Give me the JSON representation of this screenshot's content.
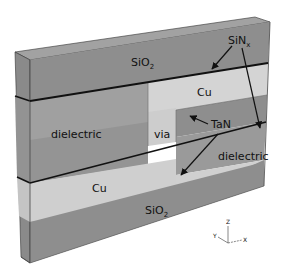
{
  "diagram": {
    "type": "3d-interconnect-cross-section",
    "labels": {
      "sio2_top": "SiO",
      "sio2_top_sub": "2",
      "sinx": "SiN",
      "sinx_sub": "x",
      "cu_top": "Cu",
      "dielectric_left": "dielectric",
      "via": "via",
      "tan": "TaN",
      "dielectric_right": "dielectric",
      "cu_bottom": "Cu",
      "sio2_bottom": "SiO",
      "sio2_bottom_sub": "2"
    },
    "axes": {
      "z": "Z",
      "y": "Y",
      "x": "X"
    },
    "colors": {
      "sio2": "#8c8c8c",
      "sio2_top_face": "#9a9a9a",
      "side_face": "#7a7a7a",
      "dielectric": "#999999",
      "dielectric_light": "#a8a8a8",
      "cu": "#d2d2d2",
      "via": "#cfcfcf",
      "sinx_line": "#111111",
      "arrow": "#111111"
    }
  }
}
